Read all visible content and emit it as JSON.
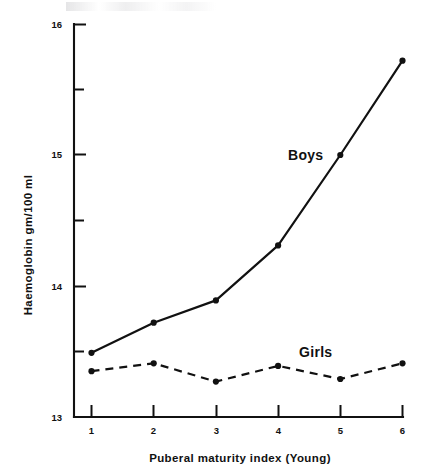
{
  "chart_data": {
    "type": "line",
    "title": "",
    "xlabel": "Puberal maturity index (Young)",
    "ylabel": "Haemoglobin  gm/100 ml",
    "x": [
      1,
      2,
      3,
      4,
      5,
      6
    ],
    "xticklabels": [
      "1",
      "2",
      "3",
      "4",
      "5",
      "6"
    ],
    "yticklabels": [
      "13",
      "14",
      "15",
      "16"
    ],
    "yticks": [
      13,
      14,
      15,
      16
    ],
    "yminorticks": [
      13.5,
      14.5,
      15.5
    ],
    "xlim": [
      0.55,
      6.25
    ],
    "ylim": [
      13,
      16
    ],
    "grid": false,
    "legend_position": "inline-annotation",
    "series": [
      {
        "name": "Boys",
        "style": "solid",
        "marker": "filled-circle",
        "values": [
          13.49,
          13.72,
          13.89,
          14.31,
          15.0,
          15.72
        ]
      },
      {
        "name": "Girls",
        "style": "dashed",
        "marker": "filled-circle",
        "values": [
          13.35,
          13.41,
          13.27,
          13.39,
          13.29,
          13.41
        ]
      }
    ],
    "annotations": [
      {
        "text": "Boys",
        "x": 4.62,
        "y": 15.02
      },
      {
        "text": "Girls",
        "x": 4.68,
        "y": 13.55
      }
    ],
    "colors": {
      "ink": "#111111",
      "background": "#ffffff"
    }
  }
}
